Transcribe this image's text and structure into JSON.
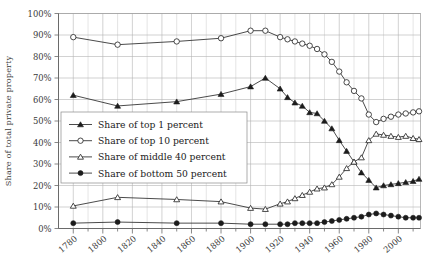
{
  "chart_data": {
    "type": "line",
    "title": "",
    "xlabel": "",
    "ylabel": "Share of total private property",
    "xlim": [
      1770,
      2015
    ],
    "ylim": [
      0,
      100
    ],
    "grid": true,
    "legend_position": "inside-left-middle",
    "y_tick_labels": [
      "0%",
      "10%",
      "20%",
      "30%",
      "40%",
      "50%",
      "60%",
      "70%",
      "80%",
      "90%",
      "100%"
    ],
    "y_tick_values": [
      0,
      10,
      20,
      30,
      40,
      50,
      60,
      70,
      80,
      90,
      100
    ],
    "x_tick_labels": [
      "1780",
      "1800",
      "1820",
      "1840",
      "1860",
      "1880",
      "1900",
      "1920",
      "1940",
      "1960",
      "1980",
      "2000"
    ],
    "x_tick_values": [
      1780,
      1800,
      1820,
      1840,
      1860,
      1880,
      1900,
      1920,
      1940,
      1960,
      1980,
      2000
    ],
    "series": [
      {
        "name": "Share of top 1 percent",
        "marker": "filled-triangle",
        "x": [
          1780,
          1810,
          1850,
          1880,
          1900,
          1910,
          1920,
          1925,
          1930,
          1935,
          1940,
          1945,
          1950,
          1955,
          1960,
          1965,
          1970,
          1975,
          1980,
          1985,
          1990,
          1995,
          2000,
          2005,
          2010,
          2014
        ],
        "values": [
          62,
          57,
          59,
          62.5,
          66,
          70,
          65,
          61,
          58.5,
          57,
          54,
          53.5,
          50,
          46.5,
          41,
          36,
          31,
          26,
          22.5,
          19,
          20,
          20.5,
          21,
          21.5,
          22,
          23
        ]
      },
      {
        "name": "Share of top 10 percent",
        "marker": "open-circle",
        "x": [
          1780,
          1810,
          1850,
          1880,
          1900,
          1910,
          1920,
          1925,
          1930,
          1935,
          1940,
          1945,
          1950,
          1955,
          1960,
          1965,
          1970,
          1975,
          1980,
          1985,
          1990,
          1995,
          2000,
          2005,
          2010,
          2014
        ],
        "values": [
          89,
          85.5,
          87,
          88.5,
          92,
          92,
          89,
          88,
          87,
          86,
          85,
          83.5,
          81,
          77.5,
          73,
          68,
          64,
          60.5,
          53,
          49.5,
          51,
          52,
          53,
          53.5,
          54,
          54.5
        ]
      },
      {
        "name": "Share of middle 40 percent",
        "marker": "open-triangle",
        "x": [
          1780,
          1810,
          1850,
          1880,
          1900,
          1910,
          1920,
          1925,
          1930,
          1935,
          1940,
          1945,
          1950,
          1955,
          1960,
          1965,
          1970,
          1975,
          1980,
          1985,
          1990,
          1995,
          2000,
          2005,
          2010,
          2014
        ],
        "values": [
          10.5,
          14.5,
          13.5,
          12.5,
          9.5,
          9,
          11.5,
          12.5,
          14,
          15.5,
          17,
          18.5,
          19,
          20.5,
          24,
          28,
          31,
          33,
          41,
          44,
          43.5,
          43,
          42.5,
          43,
          42,
          41.5
        ]
      },
      {
        "name": "Share of bottom 50 percent",
        "marker": "filled-circle",
        "x": [
          1780,
          1810,
          1850,
          1880,
          1900,
          1910,
          1920,
          1925,
          1930,
          1935,
          1940,
          1945,
          1950,
          1955,
          1960,
          1965,
          1970,
          1975,
          1980,
          1985,
          1990,
          1995,
          2000,
          2005,
          2010,
          2014
        ],
        "values": [
          2.5,
          3,
          2.5,
          2.5,
          2,
          2,
          2,
          2,
          2.5,
          2.5,
          2.5,
          2.5,
          3,
          3.5,
          4,
          4.5,
          5,
          5.5,
          6.5,
          7,
          6.5,
          6,
          5.5,
          5,
          5,
          5
        ]
      }
    ]
  },
  "legend": {
    "items": [
      {
        "label": "Share of top 1 percent",
        "marker": "filled-triangle"
      },
      {
        "label": "Share of top 10 percent",
        "marker": "open-circle"
      },
      {
        "label": "Share of middle 40 percent",
        "marker": "open-triangle"
      },
      {
        "label": "Share of bottom 50 percent",
        "marker": "filled-circle"
      }
    ]
  },
  "axes": {
    "y_title": "Share of total private property"
  }
}
